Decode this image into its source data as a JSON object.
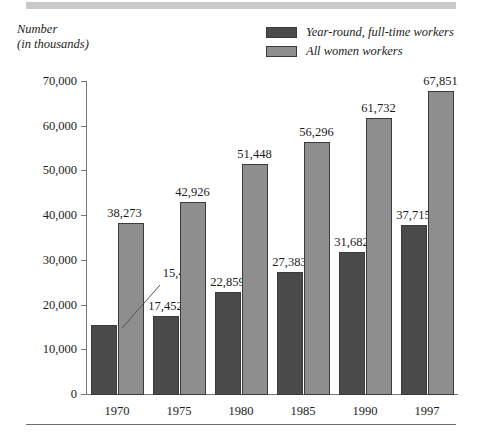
{
  "axis_caption": {
    "line1": "Number",
    "line2": "(in thousands)"
  },
  "legend": {
    "items": [
      {
        "label": "Year-round, full-time workers",
        "color": "#4a4a4a"
      },
      {
        "label": "All women workers",
        "color": "#8e8e8e"
      }
    ]
  },
  "colors": {
    "dark_series": "#4a4a4a",
    "light_series": "#8e8e8e",
    "bar_outline": "#3b3b3b",
    "axis": "#777777",
    "top_band": "#c9c9c9",
    "bottom_rule": "#6f6f6f",
    "text": "#1c1c1c"
  },
  "chart_data": {
    "type": "bar",
    "title": "",
    "xlabel": "",
    "ylabel": "Number (in thousands)",
    "categories": [
      "1970",
      "1975",
      "1980",
      "1985",
      "1990",
      "1997"
    ],
    "ylim": [
      0,
      70000
    ],
    "yticks": [
      0,
      10000,
      20000,
      30000,
      40000,
      50000,
      60000,
      70000
    ],
    "ytick_labels": [
      "0",
      "10,000",
      "20,000",
      "30,000",
      "40,000",
      "50,000",
      "60,000",
      "70,000"
    ],
    "grid": false,
    "legend_position": "top-right",
    "series": [
      {
        "name": "Year-round, full-time workers",
        "color": "#4a4a4a",
        "values": [
          15476,
          17452,
          22859,
          27383,
          31682,
          37715
        ],
        "value_labels": [
          "15,476",
          "17,452",
          "22,859",
          "27,383",
          "31,682",
          "37,715"
        ]
      },
      {
        "name": "All women workers",
        "color": "#8e8e8e",
        "values": [
          38273,
          42926,
          51448,
          56296,
          61732,
          67851
        ],
        "value_labels": [
          "38,273",
          "42,926",
          "51,448",
          "56,296",
          "61,732",
          "67,851"
        ]
      }
    ],
    "annotations": [
      {
        "text": "15,476",
        "note": "leader line connects the 15,476 label to the top of the 1970 dark bar"
      }
    ]
  }
}
